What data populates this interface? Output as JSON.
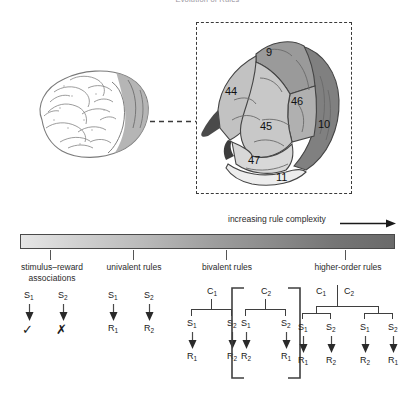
{
  "figure": {
    "title": "Evolution of Rules",
    "axis_label": "increasing rule complexity"
  },
  "brain": {
    "small_brain_name": "lateral view of human brain",
    "inset_name": "prefrontal cortex magnified",
    "regions": [
      {
        "label": "9",
        "x": 268,
        "y": 49,
        "shade": "#9a9a9a"
      },
      {
        "label": "44",
        "x": 228,
        "y": 89,
        "shade": "#c2c2c2"
      },
      {
        "label": "46",
        "x": 292,
        "y": 99,
        "shade": "#b0b0b0"
      },
      {
        "label": "45",
        "x": 261,
        "y": 124,
        "shade": "#c8c8c8"
      },
      {
        "label": "10",
        "x": 320,
        "y": 121,
        "shade": "#808080"
      },
      {
        "label": "47",
        "x": 248,
        "y": 158,
        "shade": "#d8d8d8"
      },
      {
        "label": "11",
        "x": 275,
        "y": 175,
        "shade": "#ededed"
      }
    ]
  },
  "scale": {
    "gradient_from": "#e6e6e6",
    "gradient_to": "#6a6a6a",
    "ticks": [
      50,
      133,
      226,
      345
    ],
    "categories": [
      {
        "id": "stimulus-reward",
        "line1": "stimulus–reward",
        "line2": "associations"
      },
      {
        "id": "univalent",
        "line1": "univalent rules",
        "line2": ""
      },
      {
        "id": "bivalent",
        "line1": "bivalent rules",
        "line2": ""
      },
      {
        "id": "higher-order",
        "line1": "higher-order rules",
        "line2": ""
      }
    ]
  },
  "trees": {
    "stimulus_reward": {
      "name": "stimulus-reward-tree",
      "stimuli": [
        "S",
        "S"
      ],
      "stim_subs": [
        "1",
        "2"
      ],
      "outcomes": [
        "✓",
        "✗"
      ],
      "outcome_names": [
        "check-icon",
        "cross-icon"
      ]
    },
    "univalent": {
      "name": "univalent-rules-tree",
      "pairs": [
        {
          "s": "S",
          "s_sub": "1",
          "r": "R",
          "r_sub": "1"
        },
        {
          "s": "S",
          "s_sub": "2",
          "r": "R",
          "r_sub": "2"
        }
      ]
    },
    "bivalent": {
      "name": "bivalent-rules-tree",
      "groups": [
        {
          "context": "C",
          "context_sub": "1",
          "bracketed": false,
          "pairs": [
            {
              "s": "S",
              "s_sub": "1",
              "r": "R",
              "r_sub": "1"
            },
            {
              "s": "S",
              "s_sub": "2",
              "r": "R",
              "r_sub": "2"
            }
          ]
        },
        {
          "context": "C",
          "context_sub": "2",
          "bracketed": true,
          "pairs": [
            {
              "s": "S",
              "s_sub": "1",
              "r": "R",
              "r_sub": "2"
            },
            {
              "s": "S",
              "s_sub": "2",
              "r": "R",
              "r_sub": "1"
            }
          ]
        }
      ]
    },
    "higher_order": {
      "name": "higher-order-rules-tree",
      "contexts": [
        {
          "c": "C",
          "c_sub": "1"
        },
        {
          "c": "C",
          "c_sub": "2"
        }
      ],
      "branches": [
        {
          "pairs": [
            {
              "s": "S",
              "s_sub": "1",
              "r": "R",
              "r_sub": "1"
            },
            {
              "s": "S",
              "s_sub": "2",
              "r": "R",
              "r_sub": "2"
            }
          ]
        },
        {
          "pairs": [
            {
              "s": "S",
              "s_sub": "1",
              "r": "R",
              "r_sub": "2"
            },
            {
              "s": "S",
              "s_sub": "2",
              "r": "R",
              "r_sub": "1"
            }
          ]
        }
      ]
    }
  }
}
